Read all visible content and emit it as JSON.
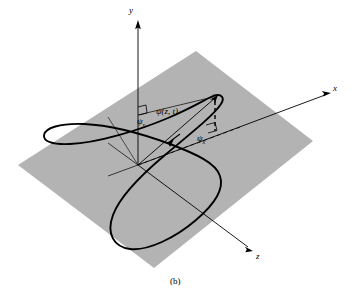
{
  "figure": {
    "caption": "(b)",
    "colors": {
      "plane_fill": "#b3b3b3",
      "curve_stroke": "#000000",
      "axis_stroke": "#000000",
      "background": "#ffffff"
    },
    "axes": [
      {
        "id": "y",
        "label": "y",
        "label_x": 131,
        "label_y": 12
      },
      {
        "id": "x",
        "label": "x",
        "label_x": 334,
        "label_y": 90
      },
      {
        "id": "z",
        "label": "z",
        "label_x": 257,
        "label_y": 258
      }
    ],
    "angle_labels": [
      {
        "id": "psi-y",
        "base": "ψ",
        "sub": "y",
        "x": 139,
        "y": 122
      },
      {
        "id": "psi-z-t",
        "base": "ψ(z, t)",
        "sub": "",
        "x": 158,
        "y": 113
      },
      {
        "id": "psi-x",
        "base": "ψ",
        "sub": "x",
        "x": 199,
        "y": 139
      }
    ],
    "plane": {
      "name": "reference-plane",
      "points": "196,51 313,141 154,268 18,165"
    },
    "curve": {
      "name": "displacement-loop-curve",
      "description": "closed loop trajectory of the whirling string element"
    },
    "vector": {
      "name": "displacement-vector",
      "description": "vector from origin to the tip of the loop"
    }
  }
}
